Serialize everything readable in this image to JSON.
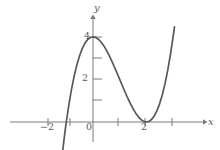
{
  "figure": {
    "background_color": "#ffffff",
    "curve_color": "#585858",
    "axis_color": "#7a7a7a",
    "label_color": "#5a5a5a"
  },
  "axes": {
    "x_axis_name": "x",
    "y_axis_name": "y",
    "x_ticks": [
      {
        "value": -2,
        "label": "−2"
      },
      {
        "value": -1,
        "label": ""
      },
      {
        "value": 0,
        "label": "0"
      },
      {
        "value": 1,
        "label": ""
      },
      {
        "value": 2,
        "label": "2"
      },
      {
        "value": 3,
        "label": ""
      }
    ],
    "y_ticks": [
      {
        "value": 1,
        "label": ""
      },
      {
        "value": 2,
        "label": "2"
      },
      {
        "value": 3,
        "label": ""
      },
      {
        "value": 4,
        "label": "4"
      }
    ]
  },
  "chart_data": {
    "type": "line",
    "title": "",
    "subtitle": "",
    "xlabel": "x",
    "ylabel": "y",
    "xlim": [
      -3.2,
      4.4
    ],
    "ylim": [
      -1.4,
      5.6
    ],
    "grid": false,
    "legend": null,
    "x_tick_labels": [
      "−2",
      "0",
      "2"
    ],
    "y_tick_labels": [
      "2",
      "4"
    ],
    "series": [
      {
        "name": "y = (x+1)(x−2)^2",
        "color": "#585858",
        "x": [
          -1.35,
          -1.25,
          -1.15,
          -1.05,
          -1.0,
          -0.9,
          -0.8,
          -0.7,
          -0.6,
          -0.5,
          -0.4,
          -0.3,
          -0.2,
          -0.1,
          0.0,
          0.1,
          0.2,
          0.3,
          0.4,
          0.5,
          0.6,
          0.7,
          0.8,
          0.9,
          1.0,
          1.1,
          1.2,
          1.3,
          1.4,
          1.5,
          1.6,
          1.7,
          1.8,
          1.9,
          2.0,
          2.1,
          2.2,
          2.3,
          2.4,
          2.5,
          2.6,
          2.7,
          2.8,
          2.9,
          3.0,
          3.05
        ],
        "y": [
          -4.26,
          -3.52,
          -2.82,
          -2.15,
          -1.84,
          -1.25,
          -0.7,
          -0.17,
          0.34,
          0.81,
          1.25,
          1.67,
          2.05,
          2.4,
          4.0,
          3.99,
          3.89,
          3.71,
          3.46,
          3.15,
          2.82,
          2.45,
          2.08,
          1.71,
          1.35,
          1.01,
          0.7,
          0.44,
          0.23,
          0.09,
          0.02,
          0.01,
          0.03,
          0.09,
          0.0,
          0.03,
          0.13,
          0.3,
          0.54,
          0.88,
          1.3,
          1.81,
          2.43,
          3.16,
          4.0,
          4.43
        ],
        "roots": [
          -1,
          2
        ],
        "local_maximum": {
          "x": 0,
          "y": 4
        },
        "local_minimum": {
          "x": 2,
          "y": 0
        },
        "double_root": 2
      }
    ]
  }
}
